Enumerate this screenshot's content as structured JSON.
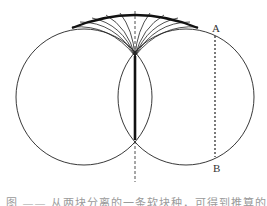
{
  "figure": {
    "labels": {
      "a": "A",
      "b": "B"
    },
    "caption": "图 —— 从两块分离的一条软块种，可得到推算的",
    "colors": {
      "stroke": "#222222",
      "thick": "#111111",
      "caption": "#9a9a9a"
    },
    "geometry": {
      "left_circle": {
        "cx": 84,
        "cy": 97,
        "r": 68
      },
      "right_circle": {
        "cx": 186,
        "cy": 97,
        "r": 68
      },
      "center_axis_x": 135,
      "dotted_chord": {
        "x": 215,
        "y1": 36,
        "y2": 157
      }
    }
  }
}
